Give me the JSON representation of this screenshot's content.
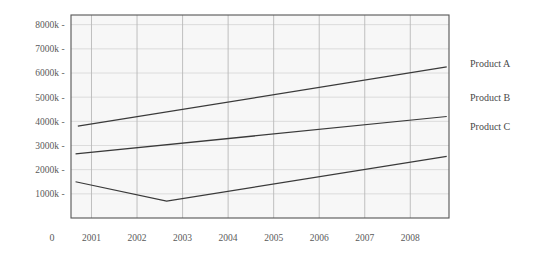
{
  "chart_data": {
    "type": "line",
    "title": "",
    "subtitle": "",
    "xlabel": "",
    "ylabel": "",
    "origin_label": "0",
    "grid": true,
    "legend_position": "right",
    "x": [
      2001,
      2002,
      2003,
      2004,
      2005,
      2006,
      2007,
      2008
    ],
    "xtick_labels": [
      "2001",
      "2002",
      "2003",
      "2004",
      "2005",
      "2006",
      "2007",
      "2008"
    ],
    "ytick_labels": [
      "8000k",
      "7000k",
      "6000k",
      "5000k",
      "4000k",
      "3000k",
      "2000k",
      "1000k"
    ],
    "ytick_values": [
      8000,
      7000,
      6000,
      5000,
      4000,
      3000,
      2000,
      1000
    ],
    "ylim": [
      0,
      8400
    ],
    "xlim": [
      2000.55,
      2008.85
    ],
    "series": [
      {
        "name": "Product A",
        "color": "#3a3a3a",
        "x": [
          2000.7,
          2008.8
        ],
        "values": [
          3800,
          6250
        ]
      },
      {
        "name": "Product B",
        "color": "#3a3a3a",
        "x": [
          2000.65,
          2008.8
        ],
        "values": [
          2650,
          4200
        ]
      },
      {
        "name": "Product C",
        "color": "#3a3a3a",
        "x": [
          2000.65,
          2002.65,
          2008.8
        ],
        "values": [
          1500,
          700,
          2550
        ]
      }
    ]
  },
  "legend": {
    "items": [
      {
        "label": "Product A"
      },
      {
        "label": "Product B"
      },
      {
        "label": "Product C"
      }
    ]
  },
  "axis": {
    "tick_dash": "-"
  },
  "colors": {
    "plot_background": "#f7f7f7",
    "grid_major": "#b9b9b9",
    "grid_minor": "#d8d8d8",
    "frame": "#555555",
    "line": "#3a3a3a",
    "text": "#4a4a4a"
  }
}
